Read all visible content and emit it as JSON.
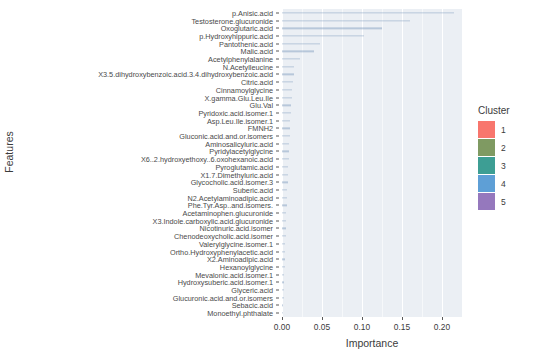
{
  "chart_data": {
    "type": "bar",
    "orientation": "horizontal",
    "title": "",
    "xlabel": "Importance",
    "ylabel": "Features",
    "xlim": [
      0.0,
      0.225
    ],
    "xticks": [
      0.0,
      0.05,
      0.1,
      0.15,
      0.2
    ],
    "xtick_labels": [
      "0.00",
      "0.05",
      "0.10",
      "0.15",
      "0.20"
    ],
    "grid": true,
    "legend_position": "right",
    "legend_title": "Cluster",
    "legend_entries": [
      {
        "label": "1",
        "color": "#f8766d"
      },
      {
        "label": "2",
        "color": "#7f9a62"
      },
      {
        "label": "3",
        "color": "#3d9e94"
      },
      {
        "label": "4",
        "color": "#5e9fd6"
      },
      {
        "label": "5",
        "color": "#9578bd"
      }
    ],
    "categories": [
      "p.Anisic.acid",
      "Testosterone.glucuronide",
      "Oxoglutaric.acid",
      "p.Hydroxyhippuric.acid",
      "Pantothenic.acid",
      "Malic.acid",
      "Acetylphenylalanine",
      "N.Acetylleucine",
      "X3.5.dihydroxybenzoic.acid.3.4.dihydroxybenzoic.acid",
      "Citric.acid",
      "Cinnamoylglycine",
      "X.gamma.Glu.Leu.Ile",
      "Glu.Val",
      "Pyridoxic.acid.isomer.1",
      "Asp.Leu.Ile.isomer.1",
      "FMNH2",
      "Gluconic.acid.and.or.isomers",
      "Aminosalicyluric.acid",
      "Pyridylacetylglycine",
      "X6..2.hydroxyethoxy..6.oxohexanoic.acid",
      "Pyroglutamic.acid",
      "X1.7.Dimethyluric.acid",
      "Glycocholic.acid.isomer.3",
      "Suberic.acid",
      "N2.Acetylaminoadipic.acid",
      "Phe.Tyr.Asp..and.isomers.",
      "Acetaminophen.glucuronide",
      "X3.Indole.carboxylic.acid.glucuronide",
      "Nicotinuric.acid.isomer",
      "Chenodeoxycholic.acid.isomer",
      "Valerylglycine.isomer.1",
      "Ortho.Hydroxyphenylacetic.acid",
      "X2.Aminoadipic.acid",
      "Hexanoylglycine",
      "Mevalonic.acid.isomer.1",
      "Hydroxysuberic.acid.isomer.1",
      "Glyceric.acid",
      "Glucuronic.acid.and.or.isomers",
      "Sebacic.acid",
      "Monoethyl.phthalate"
    ],
    "values": [
      0.215,
      0.16,
      0.125,
      0.102,
      0.048,
      0.04,
      0.022,
      0.0155,
      0.0145,
      0.0135,
      0.0128,
      0.012,
      0.0115,
      0.011,
      0.0105,
      0.01,
      0.0096,
      0.0092,
      0.0088,
      0.0084,
      0.008,
      0.0076,
      0.0072,
      0.0068,
      0.0064,
      0.006,
      0.0056,
      0.0052,
      0.0048,
      0.0044,
      0.0041,
      0.0038,
      0.0035,
      0.0032,
      0.0029,
      0.0026,
      0.0023,
      0.002,
      0.0017,
      0.0014
    ],
    "bar_color": "#6f8fb5"
  }
}
